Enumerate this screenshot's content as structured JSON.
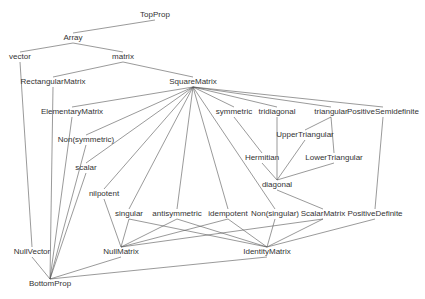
{
  "diagram": {
    "title": "",
    "line_color": "#555555",
    "text_color": "#333333",
    "nodes": [
      {
        "id": "TopProp",
        "label": "TopProp",
        "x": 155,
        "y": 15
      },
      {
        "id": "Array",
        "label": "Array",
        "x": 73,
        "y": 38
      },
      {
        "id": "vector",
        "label": "vector",
        "x": 20,
        "y": 57
      },
      {
        "id": "matrix",
        "label": "matrix",
        "x": 123,
        "y": 57
      },
      {
        "id": "RectangularMatrix",
        "label": "RectangularMatrix",
        "x": 53,
        "y": 82
      },
      {
        "id": "SquareMatrix",
        "label": "SquareMatrix",
        "x": 193,
        "y": 82
      },
      {
        "id": "ElementaryMatrix",
        "label": "ElementaryMatrix",
        "x": 72,
        "y": 112
      },
      {
        "id": "symmetric",
        "label": "symmetric",
        "x": 234,
        "y": 112
      },
      {
        "id": "tridiagonal",
        "label": "tridiagonal",
        "x": 277,
        "y": 112
      },
      {
        "id": "triangular",
        "label": "triangular",
        "x": 331,
        "y": 112
      },
      {
        "id": "PositiveSemidefinite",
        "label": "PositiveSemidefinite",
        "x": 383,
        "y": 112
      },
      {
        "id": "Non(symmetric)",
        "label": "Non(symmetric)",
        "x": 86,
        "y": 140
      },
      {
        "id": "UpperTriangular",
        "label": "UpperTriangular",
        "x": 305,
        "y": 135
      },
      {
        "id": "scalar",
        "label": "scalar",
        "x": 86,
        "y": 168
      },
      {
        "id": "Hermitian",
        "label": "Hermitian",
        "x": 262,
        "y": 158
      },
      {
        "id": "LowerTriangular",
        "label": "LowerTriangular",
        "x": 334,
        "y": 158
      },
      {
        "id": "diagonal",
        "label": "diagonal",
        "x": 277,
        "y": 185
      },
      {
        "id": "nilpotent",
        "label": "nilpotent",
        "x": 104,
        "y": 194
      },
      {
        "id": "singular",
        "label": "singular",
        "x": 129,
        "y": 214
      },
      {
        "id": "antisymmetric",
        "label": "antisymmetric",
        "x": 177,
        "y": 214
      },
      {
        "id": "idempotent",
        "label": "idempotent",
        "x": 228,
        "y": 214
      },
      {
        "id": "Non(singular)",
        "label": "Non(singular)",
        "x": 275,
        "y": 214
      },
      {
        "id": "ScalarMatrix",
        "label": "ScalarMatrix",
        "x": 323,
        "y": 214
      },
      {
        "id": "PositiveDefinite",
        "label": "PositiveDefinite",
        "x": 375,
        "y": 214
      },
      {
        "id": "NullVector",
        "label": "NullVector",
        "x": 32,
        "y": 252
      },
      {
        "id": "NullMatrix",
        "label": "NullMatrix",
        "x": 121,
        "y": 252
      },
      {
        "id": "IdentityMatrix",
        "label": "IdentityMatrix",
        "x": 267,
        "y": 252
      },
      {
        "id": "BottomProp",
        "label": "BottomProp",
        "x": 50,
        "y": 284
      }
    ],
    "edges": [
      [
        "TopProp",
        "Array"
      ],
      [
        "Array",
        "vector"
      ],
      [
        "Array",
        "matrix"
      ],
      [
        "matrix",
        "RectangularMatrix"
      ],
      [
        "matrix",
        "SquareMatrix"
      ],
      [
        "vector",
        "NullVector"
      ],
      [
        "RectangularMatrix",
        "BottomProp"
      ],
      [
        "SquareMatrix",
        "ElementaryMatrix"
      ],
      [
        "SquareMatrix",
        "Non(symmetric)"
      ],
      [
        "SquareMatrix",
        "scalar"
      ],
      [
        "SquareMatrix",
        "nilpotent"
      ],
      [
        "SquareMatrix",
        "singular"
      ],
      [
        "SquareMatrix",
        "antisymmetric"
      ],
      [
        "SquareMatrix",
        "idempotent"
      ],
      [
        "SquareMatrix",
        "Non(singular)"
      ],
      [
        "SquareMatrix",
        "symmetric"
      ],
      [
        "SquareMatrix",
        "tridiagonal"
      ],
      [
        "SquareMatrix",
        "triangular"
      ],
      [
        "SquareMatrix",
        "PositiveSemidefinite"
      ],
      [
        "symmetric",
        "Hermitian"
      ],
      [
        "tridiagonal",
        "diagonal"
      ],
      [
        "triangular",
        "UpperTriangular"
      ],
      [
        "triangular",
        "LowerTriangular"
      ],
      [
        "UpperTriangular",
        "diagonal"
      ],
      [
        "LowerTriangular",
        "diagonal"
      ],
      [
        "Hermitian",
        "diagonal"
      ],
      [
        "diagonal",
        "ScalarMatrix"
      ],
      [
        "PositiveSemidefinite",
        "PositiveDefinite"
      ],
      [
        "ElementaryMatrix",
        "BottomProp"
      ],
      [
        "Non(symmetric)",
        "BottomProp"
      ],
      [
        "scalar",
        "BottomProp"
      ],
      [
        "nilpotent",
        "NullMatrix"
      ],
      [
        "singular",
        "NullMatrix"
      ],
      [
        "antisymmetric",
        "NullMatrix"
      ],
      [
        "idempotent",
        "NullMatrix"
      ],
      [
        "ScalarMatrix",
        "NullMatrix"
      ],
      [
        "antisymmetric",
        "IdentityMatrix"
      ],
      [
        "idempotent",
        "IdentityMatrix"
      ],
      [
        "Non(singular)",
        "IdentityMatrix"
      ],
      [
        "ScalarMatrix",
        "IdentityMatrix"
      ],
      [
        "PositiveDefinite",
        "IdentityMatrix"
      ],
      [
        "singular",
        "IdentityMatrix"
      ],
      [
        "NullVector",
        "BottomProp"
      ],
      [
        "NullMatrix",
        "BottomProp"
      ],
      [
        "IdentityMatrix",
        "BottomProp"
      ]
    ]
  }
}
